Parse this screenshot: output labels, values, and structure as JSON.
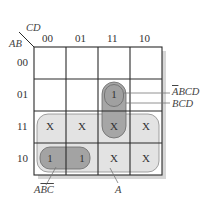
{
  "kmap": {
    "row_var": "AB",
    "col_var": "CD",
    "col_headers": [
      "00",
      "01",
      "11",
      "10"
    ],
    "row_headers": [
      "00",
      "01",
      "11",
      "10"
    ],
    "cells": [
      [
        "",
        "",
        "",
        ""
      ],
      [
        "",
        "",
        "1",
        ""
      ],
      [
        "X",
        "X",
        "X",
        "X"
      ],
      [
        "1",
        "1",
        "X",
        "X"
      ]
    ],
    "groups": [
      {
        "label": "ĀBCD",
        "bar": "A",
        "rest": "BCD",
        "color": "#9a9a9a"
      },
      {
        "label": "BCD",
        "color": "#a8a8a8"
      },
      {
        "label": "AB̄C̄",
        "color": "#a0a0a0"
      },
      {
        "label": "A",
        "color": "#e3e3e3"
      }
    ]
  },
  "labels": {
    "abar_bcd_a": "A",
    "abar_bcd_rest": "BCD",
    "bcd": "BCD",
    "a_bbar_cbar_a": "A",
    "a_bbar_cbar_b": "B",
    "a_bbar_cbar_c": "C",
    "a": "A"
  },
  "colors": {
    "grid_line": "#2a2a2a",
    "shadow": "#d4d4d4",
    "region_a": "#e3e3e3",
    "loop_dark": "#a3a3a3",
    "loop_border": "#6a6a6a"
  }
}
